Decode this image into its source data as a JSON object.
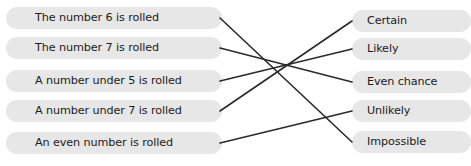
{
  "worksheet": {
    "title": "Probability matching activity",
    "background_color": "#ffffff",
    "pill_color": "#e7e7e7",
    "line_color": "#2a2a2a"
  },
  "left_column": {
    "items": [
      {
        "id": "number-6",
        "label": "The number 6 is rolled",
        "y": 18
      },
      {
        "id": "number-7",
        "label": "The number 7 is rolled",
        "y": 48
      },
      {
        "id": "under-5",
        "label": "A number under 5 is rolled",
        "y": 81
      },
      {
        "id": "under-7",
        "label": "A number under 7 is rolled",
        "y": 111
      },
      {
        "id": "even-number",
        "label": "An even number is rolled",
        "y": 143
      }
    ]
  },
  "right_column": {
    "items": [
      {
        "id": "certain",
        "label": "Certain",
        "y": 21
      },
      {
        "id": "likely",
        "label": "Likely",
        "y": 49
      },
      {
        "id": "even-chance",
        "label": "Even chance",
        "y": 82
      },
      {
        "id": "unlikely",
        "label": "Unlikely",
        "y": 111
      },
      {
        "id": "impossible",
        "label": "Impossible",
        "y": 142
      }
    ]
  },
  "connections": [
    {
      "id": "line-number6-to-impossible",
      "from": "number-6",
      "to": "impossible",
      "x1": 220,
      "y1": 18,
      "x2": 352,
      "y2": 142
    },
    {
      "id": "line-number7-to-evenchance",
      "from": "number-7",
      "to": "even-chance",
      "x1": 220,
      "y1": 48,
      "x2": 352,
      "y2": 82
    },
    {
      "id": "line-under5-to-likely",
      "from": "under-5",
      "to": "likely",
      "x1": 220,
      "y1": 81,
      "x2": 352,
      "y2": 49
    },
    {
      "id": "line-under7-to-certain",
      "from": "under-7",
      "to": "certain",
      "x1": 220,
      "y1": 111,
      "x2": 352,
      "y2": 21
    },
    {
      "id": "line-evennumber-to-unlikely",
      "from": "even-number",
      "to": "unlikely",
      "x1": 220,
      "y1": 143,
      "x2": 352,
      "y2": 111
    }
  ]
}
